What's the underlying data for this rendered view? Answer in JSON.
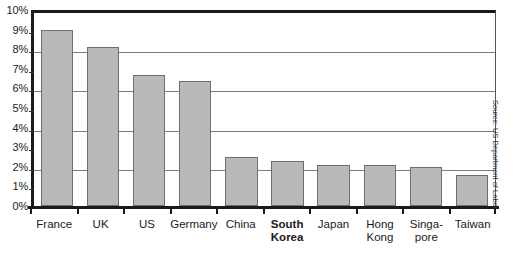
{
  "chart_data": {
    "type": "bar",
    "title": "",
    "xlabel": "",
    "ylabel": "",
    "ylim": [
      0,
      10
    ],
    "grid": true,
    "legend": false,
    "categories": [
      "France",
      "UK",
      "US",
      "Germany",
      "China",
      "South Korea",
      "Japan",
      "Hong Kong",
      "Singapore",
      "Taiwan"
    ],
    "values": [
      9.0,
      8.1,
      6.7,
      6.4,
      2.5,
      2.3,
      2.1,
      2.1,
      2.0,
      1.6
    ],
    "y_tick_labels": [
      "10%",
      "9%",
      "8%",
      "7%",
      "6%",
      "5%",
      "4%",
      "3%",
      "2%",
      "1%",
      "0%"
    ],
    "y_tick_values": [
      10,
      9,
      8,
      7,
      6,
      5,
      4,
      3,
      2,
      1,
      0
    ],
    "gridline_values": [
      10,
      8,
      6,
      4,
      2
    ],
    "highlighted_category": "South Korea",
    "bar_fill_color": "#b9b9b9",
    "bar_border_color": "#6e6e6e",
    "axis_color": "#1a1a1a",
    "gridline_color": "#7d7d7d"
  },
  "x_labels": [
    {
      "lines": [
        "France"
      ],
      "bold": false
    },
    {
      "lines": [
        "UK"
      ],
      "bold": false
    },
    {
      "lines": [
        "US"
      ],
      "bold": false
    },
    {
      "lines": [
        "Germany"
      ],
      "bold": false
    },
    {
      "lines": [
        "China"
      ],
      "bold": false
    },
    {
      "lines": [
        "South",
        "Korea"
      ],
      "bold": true
    },
    {
      "lines": [
        "Japan"
      ],
      "bold": false
    },
    {
      "lines": [
        "Hong",
        "Kong"
      ],
      "bold": false
    },
    {
      "lines": [
        "Singa-",
        "pore"
      ],
      "bold": false
    },
    {
      "lines": [
        "Taiwan"
      ],
      "bold": false
    }
  ],
  "source": {
    "text": "Source: US Department of Labor"
  }
}
